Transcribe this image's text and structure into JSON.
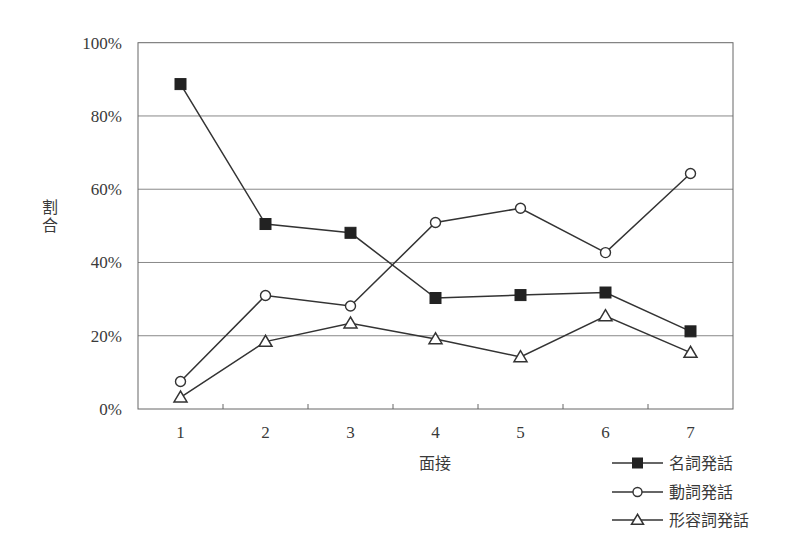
{
  "chart_data": {
    "type": "line",
    "title": "",
    "xlabel": "面接",
    "ylabel": "割合",
    "categories": [
      "1",
      "2",
      "3",
      "4",
      "5",
      "6",
      "7"
    ],
    "y_ticks": [
      "0%",
      "20%",
      "40%",
      "60%",
      "80%",
      "100%"
    ],
    "ylim": [
      0,
      100
    ],
    "grid": true,
    "legend_position": "bottom-right",
    "series": [
      {
        "name": "名詞発話",
        "marker": "filled-square",
        "values": [
          88.7,
          50.5,
          48.1,
          30.3,
          31.1,
          31.8,
          21.2
        ]
      },
      {
        "name": "動詞発話",
        "marker": "open-circle",
        "values": [
          7.5,
          31.0,
          28.1,
          50.9,
          54.8,
          42.7,
          64.3
        ]
      },
      {
        "name": "形容詞発話",
        "marker": "open-triangle",
        "values": [
          3.2,
          18.4,
          23.4,
          19.1,
          14.2,
          25.4,
          15.4
        ]
      }
    ]
  },
  "colors": {
    "line": "#333333",
    "grid": "#888888",
    "frame": "#666666",
    "marker_fill": "#222222",
    "background": "#ffffff"
  }
}
